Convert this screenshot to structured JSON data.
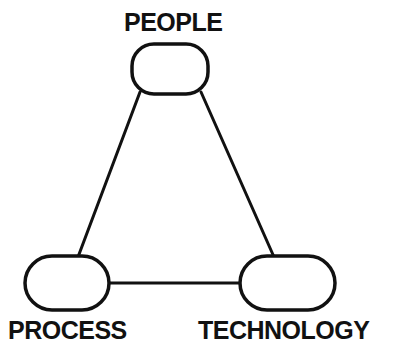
{
  "diagram": {
    "type": "triangle-relationship-diagram",
    "title": "People Process Technology",
    "background_color": "#ffffff",
    "stroke_color": "#111111",
    "stroke_width": 3,
    "nodes": [
      {
        "id": "people",
        "label": "PEOPLE",
        "shape": "rounded-rectangle",
        "label_position": "above",
        "x": 132,
        "y": 44,
        "width": 76,
        "height": 50,
        "rx": 22
      },
      {
        "id": "process",
        "label": "PROCESS",
        "shape": "rounded-rectangle",
        "label_position": "below",
        "x": 25,
        "y": 256,
        "width": 84,
        "height": 54,
        "rx": 27
      },
      {
        "id": "technology",
        "label": "TECHNOLOGY",
        "shape": "rounded-rectangle",
        "label_position": "below",
        "x": 240,
        "y": 256,
        "width": 95,
        "height": 54,
        "rx": 27
      }
    ],
    "connectors": [
      {
        "id": "people-process",
        "from": "people",
        "to": "process",
        "x1": 140,
        "y1": 92,
        "x2": 78,
        "y2": 257
      },
      {
        "id": "people-technology",
        "from": "people",
        "to": "technology",
        "x1": 201,
        "y1": 92,
        "x2": 274,
        "y2": 257
      },
      {
        "id": "process-technology",
        "from": "process",
        "to": "technology",
        "x1": 109,
        "y1": 283,
        "x2": 240,
        "y2": 283
      }
    ]
  }
}
